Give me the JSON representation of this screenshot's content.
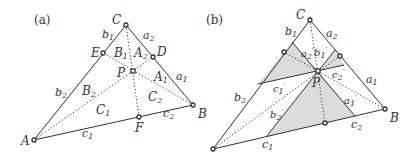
{
  "panels": [
    {
      "id": "a",
      "label": "(a)",
      "vertices": {
        "A": "A",
        "B": "B",
        "C": "C",
        "D": "D",
        "E": "E",
        "F": "F",
        "P": "P"
      },
      "side_labels": [
        "a",
        "a",
        "b",
        "b",
        "c",
        "c"
      ],
      "side_subs": [
        "2",
        "1",
        "1",
        "2",
        "1",
        "2"
      ],
      "region_labels": [
        "B",
        "A",
        "A",
        "B",
        "C",
        "C"
      ],
      "region_subs": [
        "1",
        "2",
        "1",
        "2",
        "1",
        "2"
      ]
    },
    {
      "id": "b",
      "label": "(b)",
      "vertices": {
        "A": "A",
        "B": "B",
        "C": "C",
        "P": "P"
      },
      "side_labels": [
        "a",
        "a",
        "b",
        "b",
        "c",
        "c"
      ],
      "side_subs": [
        "2",
        "1",
        "1",
        "2",
        "1",
        "2"
      ],
      "primed_labels": [
        "a",
        "b",
        "c",
        "c",
        "a",
        "b"
      ],
      "primed_subs": [
        "2",
        "1",
        "2",
        "1",
        "1",
        "2"
      ],
      "prime": "′"
    }
  ],
  "colors": {
    "line": "#333333",
    "shade": "#dcdcdc",
    "point_fill": "#ffffff"
  }
}
